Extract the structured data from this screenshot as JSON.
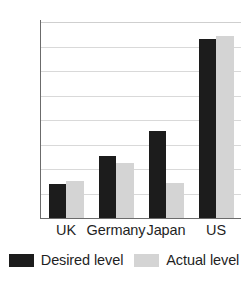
{
  "chart_data": {
    "type": "bar",
    "title": "",
    "xlabel": "",
    "ylabel": "",
    "categories": [
      "UK",
      "Germany",
      "Japan",
      "US"
    ],
    "series": [
      {
        "name": "Desired level",
        "color": "#1c1c1c",
        "values": [
          69,
          126,
          178,
          365
        ]
      },
      {
        "name": "Actual level",
        "color": "#d4d4d4",
        "values": [
          75,
          112,
          72,
          372
        ]
      }
    ],
    "ylim": [
      0,
      400
    ],
    "yticks": [
      0,
      50,
      100,
      150,
      200,
      250,
      300,
      350,
      400
    ],
    "ytick_labels": [
      "0",
      "50",
      "100",
      "150",
      "200",
      "250",
      "300",
      "350",
      "400"
    ],
    "grid": true,
    "grid_axis": "y",
    "legend_position": "bottom"
  },
  "legend": {
    "items": [
      {
        "label": "Desired level"
      },
      {
        "label": "Actual level"
      }
    ]
  }
}
